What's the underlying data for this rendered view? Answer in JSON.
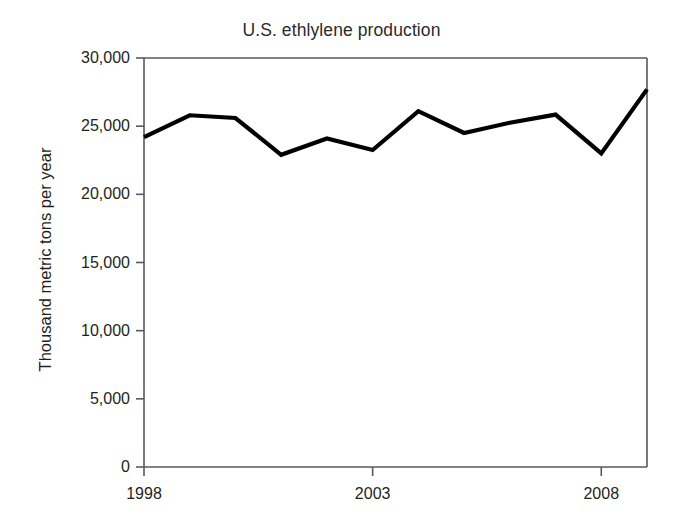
{
  "chart_data": {
    "type": "line",
    "title": "U.S. ethlylene production",
    "xlabel": "",
    "ylabel": "Thousand metric tons per year",
    "x": [
      1998,
      1999,
      2000,
      2001,
      2002,
      2003,
      2004,
      2005,
      2006,
      2007,
      2008,
      2009
    ],
    "values": [
      24200,
      25800,
      25600,
      22900,
      24100,
      23250,
      26100,
      24500,
      25250,
      25850,
      23000,
      27700
    ],
    "series": [
      {
        "name": "U.S. ethlylene production",
        "values": [
          24200,
          25800,
          25600,
          22900,
          24100,
          23250,
          26100,
          24500,
          25250,
          25850,
          23000,
          27700
        ]
      }
    ],
    "xlim": [
      1998,
      2009
    ],
    "ylim": [
      0,
      30000
    ],
    "ytick_values": [
      0,
      5000,
      10000,
      15000,
      20000,
      25000,
      30000
    ],
    "ytick_labels": [
      "0",
      "5,000",
      "10,000",
      "15,000",
      "20,000",
      "25,000",
      "30,000"
    ],
    "xtick_values": [
      1998,
      2003,
      2008
    ],
    "xtick_labels": [
      "1998",
      "2003",
      "2008"
    ],
    "grid": false,
    "legend": null,
    "line_color": "#000000",
    "axis_color": "#58595b"
  }
}
